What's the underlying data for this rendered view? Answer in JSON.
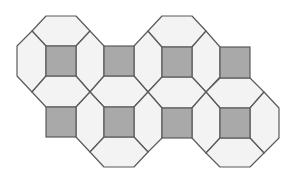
{
  "diagram": {
    "type": "truncated-square-tiling-fragment",
    "colors": {
      "background": "#ffffff",
      "light_tile": "#f3f3f3",
      "dark_square": "#a9a9a9",
      "stroke": "#5a5a5a"
    },
    "stroke_width": 1.2,
    "dark_squares": [
      {
        "x": 46,
        "y": 46,
        "w": 30,
        "h": 30
      },
      {
        "x": 104,
        "y": 46,
        "w": 30,
        "h": 30
      },
      {
        "x": 162,
        "y": 47,
        "w": 30,
        "h": 30
      },
      {
        "x": 220,
        "y": 47,
        "w": 30,
        "h": 31
      },
      {
        "x": 46,
        "y": 107,
        "w": 30,
        "h": 30
      },
      {
        "x": 104,
        "y": 107,
        "w": 30,
        "h": 30
      },
      {
        "x": 162,
        "y": 108,
        "w": 30,
        "h": 30
      },
      {
        "x": 220,
        "y": 108,
        "w": 30,
        "h": 30
      }
    ],
    "light_tiles": [
      {
        "name": "top-over-sq1",
        "points": "46,16 76,16 90,31 76,46 46,46 32,31"
      },
      {
        "name": "left-of-sq1",
        "points": "17,46 32,31 46,46 46,76 32,92 17,76"
      },
      {
        "name": "between-sq1-sq2",
        "points": "76,46 90,31 104,46 104,76 90,92 76,76"
      },
      {
        "name": "between-sq2-sq3",
        "points": "134,46 148,31 162,47 162,77 148,92 134,76"
      },
      {
        "name": "top-over-sq3",
        "points": "162,16 192,16 206,31 192,47 162,47 148,31"
      },
      {
        "name": "between-sq3-sq4",
        "points": "192,47 206,31 220,47 220,77 206,92 192,77"
      },
      {
        "name": "below-sq1",
        "points": "46,76 76,76 90,92 76,107 46,107 32,92"
      },
      {
        "name": "below-sq2",
        "points": "104,76 134,76 148,92 134,107 104,107 90,92"
      },
      {
        "name": "below-sq3",
        "points": "162,77 192,77 206,92 192,108 162,108 148,92"
      },
      {
        "name": "below-sq4",
        "points": "220,78 250,78 264,92 250,108 220,108 206,92"
      },
      {
        "name": "between-bsq1-bsq2",
        "points": "76,107 90,92 104,107 104,137 90,152 76,137"
      },
      {
        "name": "between-bsq2-bsq3",
        "points": "134,107 148,92 162,108 162,138 148,152 134,137"
      },
      {
        "name": "between-bsq3-bsq4",
        "points": "192,108 206,92 220,108 220,138 206,153 192,138"
      },
      {
        "name": "right-of-bsq4",
        "points": "250,108 264,92 279,108 279,138 264,153 250,138"
      },
      {
        "name": "bottom-under-bsq2",
        "points": "104,137 134,137 148,152 134,167 104,167 90,152"
      },
      {
        "name": "bottom-under-bsq4",
        "points": "220,138 250,138 264,153 250,167 220,167 206,153"
      }
    ]
  }
}
